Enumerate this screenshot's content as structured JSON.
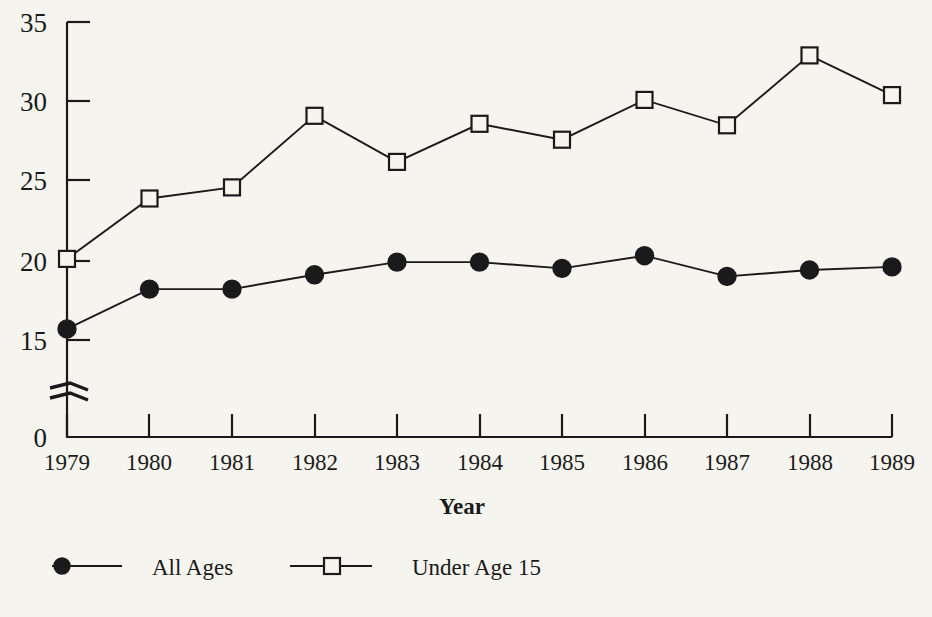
{
  "chart_data": {
    "type": "line",
    "title": "",
    "xlabel": "Year",
    "ylabel": "",
    "categories": [
      "1979",
      "1980",
      "1981",
      "1982",
      "1983",
      "1984",
      "1985",
      "1986",
      "1987",
      "1988",
      "1989"
    ],
    "x": [
      1979,
      1980,
      1981,
      1982,
      1983,
      1984,
      1985,
      1986,
      1987,
      1988,
      1989
    ],
    "series": [
      {
        "name": "All Ages",
        "marker": "filled-circle",
        "values": [
          15.7,
          18.2,
          18.2,
          19.1,
          19.9,
          19.9,
          19.5,
          20.3,
          19.0,
          19.4,
          19.6
        ]
      },
      {
        "name": "Under Age 15",
        "marker": "open-square",
        "values": [
          20.1,
          23.9,
          24.6,
          29.1,
          26.2,
          28.6,
          27.6,
          30.1,
          28.5,
          32.9,
          30.4
        ]
      }
    ],
    "ylim": [
      13.5,
      35
    ],
    "yticks": [
      0,
      15,
      20,
      25,
      30,
      35
    ],
    "ytick_labels": [
      "0",
      "15",
      "20",
      "25",
      "30",
      "35"
    ],
    "axis_break": true,
    "axis_break_note": "y-axis broken between 0 and 15",
    "grid": false,
    "legend_position": "bottom-left",
    "colors": {
      "line": "#1a1a1a",
      "background": "#f6f4ef",
      "axis": "#1a1a1a"
    }
  },
  "legend": {
    "entries": [
      {
        "label": "All Ages",
        "marker": "filled-circle-marker"
      },
      {
        "label": "Under Age 15",
        "marker": "open-square-marker"
      }
    ]
  },
  "axes": {
    "x_title": "Year",
    "y_tick_0": "0",
    "y_tick_15": "15",
    "y_tick_20": "20",
    "y_tick_25": "25",
    "y_tick_30": "30",
    "y_tick_35": "35",
    "x_tick_1979": "1979",
    "x_tick_1980": "1980",
    "x_tick_1981": "1981",
    "x_tick_1982": "1982",
    "x_tick_1983": "1983",
    "x_tick_1984": "1984",
    "x_tick_1985": "1985",
    "x_tick_1986": "1986",
    "x_tick_1987": "1987",
    "x_tick_1988": "1988",
    "x_tick_1989": "1989"
  }
}
